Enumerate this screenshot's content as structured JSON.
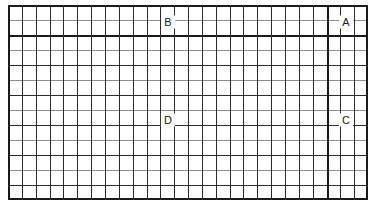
{
  "diagram": {
    "background_color": "#ffffff",
    "grid": {
      "origin_x": 8,
      "origin_y": 5,
      "width": 360,
      "height": 195,
      "columns": 26,
      "rows": 13,
      "cell_width": 13.85,
      "cell_height": 15.0,
      "minor_line_color": "#8c8c8c",
      "major_line_color": "#2b2b2b",
      "heavy_line_color": "#1a1a1a",
      "border_color": "#1a1a1a"
    },
    "emphasis_lines": [
      {
        "name": "heavy-horizontal-rule",
        "orientation": "horizontal",
        "row_index": 2
      },
      {
        "name": "heavy-vertical-rule",
        "orientation": "vertical",
        "column_index": 23
      }
    ],
    "callouts": [
      {
        "id": "B",
        "label": "B",
        "x": 168,
        "y": 22
      },
      {
        "id": "A",
        "label": "A",
        "x": 346,
        "y": 22
      },
      {
        "id": "D",
        "label": "D",
        "x": 168,
        "y": 120
      },
      {
        "id": "C",
        "label": "C",
        "x": 346,
        "y": 120
      }
    ]
  }
}
